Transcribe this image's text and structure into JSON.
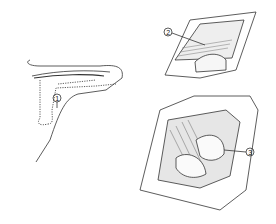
{
  "figure": {
    "panels": [
      {
        "id": "thumb-outline",
        "description": "Thumb with incision line",
        "callout": "1"
      },
      {
        "id": "incision-view",
        "description": "Skin incision with exposure",
        "callout": "2"
      },
      {
        "id": "joint-exposure",
        "description": "Exposed joint with retracted tissues",
        "callout": "3"
      }
    ]
  }
}
